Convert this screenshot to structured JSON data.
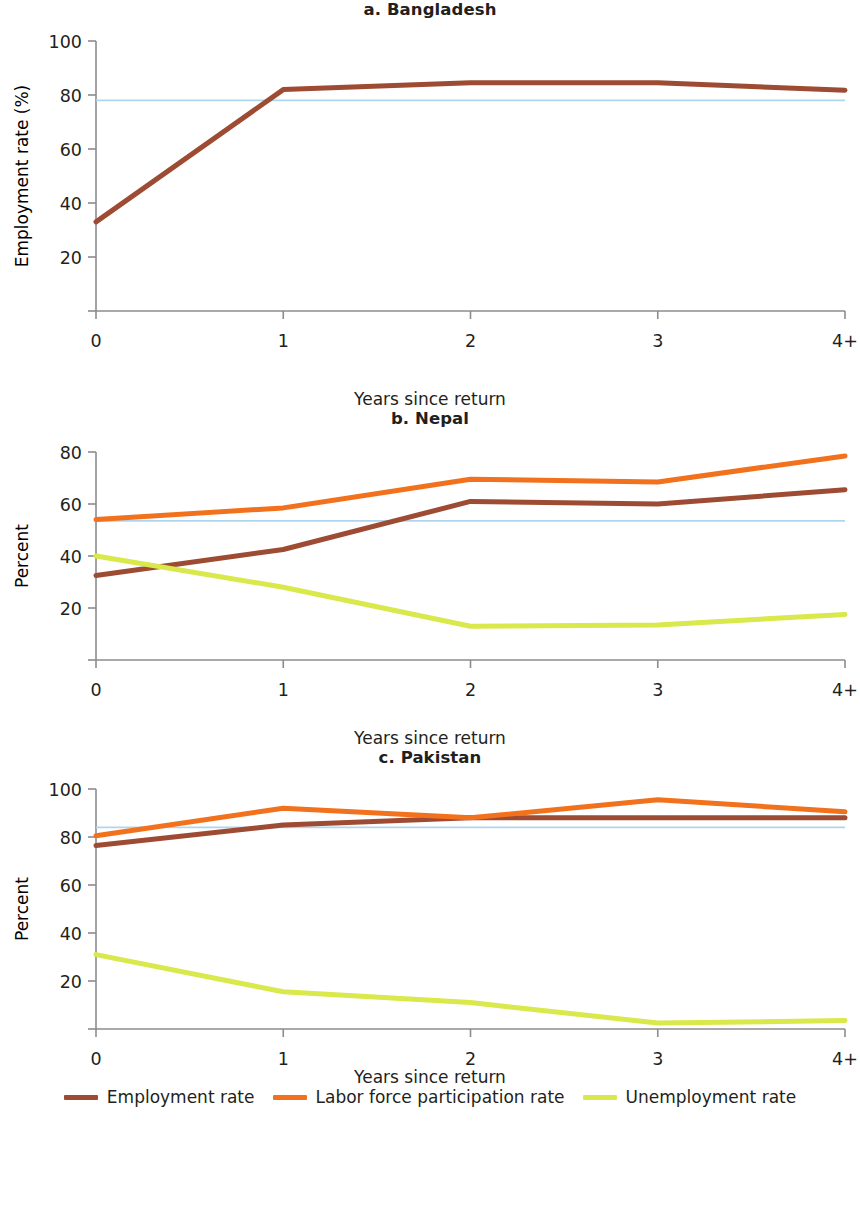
{
  "figure": {
    "x_axis_title": "Years since return",
    "categories": [
      "0",
      "1",
      "2",
      "3",
      "4+"
    ]
  },
  "colors": {
    "employment": "#9E4B33",
    "labor_force": "#F2711C",
    "unemployment": "#D9E84A",
    "reference_line": "#AFD6EE",
    "axis": "#8c8c8c",
    "text": "#231f20"
  },
  "legend": {
    "items": [
      {
        "label": "Employment rate",
        "color": "#9E4B33"
      },
      {
        "label": "Labor force participation rate",
        "color": "#F2711C"
      },
      {
        "label": "Unemployment rate",
        "color": "#D9E84A"
      }
    ]
  },
  "chart_data": [
    {
      "type": "line",
      "title": "a. Bangladesh",
      "xlabel": "Years since return",
      "ylabel": "Employment rate (%)",
      "x": [
        "0",
        "1",
        "2",
        "3",
        "4+"
      ],
      "ylim": [
        0,
        100
      ],
      "yticks": [
        0,
        20,
        40,
        60,
        80,
        100
      ],
      "ytick_labels": [
        "",
        "20",
        "40",
        "60",
        "80",
        "100"
      ],
      "grid": false,
      "legend_position": "bottom",
      "reference_line": {
        "value": 78,
        "label": "",
        "color": "#AFD6EE"
      },
      "series": [
        {
          "name": "Employment rate",
          "color": "#9E4B33",
          "values": [
            33,
            82,
            84.5,
            84.5,
            81.8
          ]
        }
      ]
    },
    {
      "type": "line",
      "title": "b. Nepal",
      "xlabel": "Years since return",
      "ylabel": "Percent",
      "x": [
        "0",
        "1",
        "2",
        "3",
        "4+"
      ],
      "ylim": [
        0,
        80
      ],
      "yticks": [
        0,
        20,
        40,
        60,
        80
      ],
      "ytick_labels": [
        "",
        "20",
        "40",
        "60",
        "80"
      ],
      "grid": false,
      "legend_position": "bottom",
      "reference_line": {
        "value": 53.5,
        "label": "",
        "color": "#AFD6EE"
      },
      "series": [
        {
          "name": "Employment rate",
          "color": "#9E4B33",
          "values": [
            32.5,
            42.5,
            61,
            60,
            65.5
          ]
        },
        {
          "name": "Labor force participation rate",
          "color": "#F2711C",
          "values": [
            54,
            58.5,
            69.5,
            68.5,
            78.5
          ]
        },
        {
          "name": "Unemployment rate",
          "color": "#D9E84A",
          "values": [
            40,
            28,
            13,
            13.5,
            17.5
          ]
        }
      ]
    },
    {
      "type": "line",
      "title": "c. Pakistan",
      "xlabel": "Years since return",
      "ylabel": "Percent",
      "x": [
        "0",
        "1",
        "2",
        "3",
        "4+"
      ],
      "ylim": [
        0,
        100
      ],
      "yticks": [
        0,
        20,
        40,
        60,
        80,
        100
      ],
      "ytick_labels": [
        "",
        "20",
        "40",
        "60",
        "80",
        "100"
      ],
      "grid": false,
      "legend_position": "bottom",
      "reference_line": {
        "value": 84,
        "label": "",
        "color": "#AFD6EE"
      },
      "series": [
        {
          "name": "Employment rate",
          "color": "#9E4B33",
          "values": [
            76.5,
            85,
            88,
            88,
            88
          ]
        },
        {
          "name": "Labor force participation rate",
          "color": "#F2711C",
          "values": [
            80.5,
            92,
            88,
            95.5,
            90.5
          ]
        },
        {
          "name": "Unemployment rate",
          "color": "#D9E84A",
          "values": [
            31,
            15.5,
            11,
            2.5,
            3.5
          ]
        }
      ]
    }
  ]
}
